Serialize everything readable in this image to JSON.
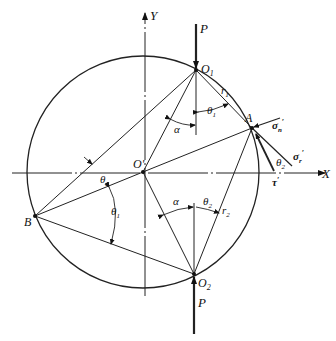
{
  "diagram": {
    "type": "geometric-stress-diagram",
    "axes": {
      "x_label": "X",
      "y_label": "Y"
    },
    "points": {
      "center": "O'",
      "top": "O",
      "top_sub": "1",
      "bottom": "O",
      "bottom_sub": "2",
      "right": "A",
      "left": "B"
    },
    "loads": {
      "top": "P",
      "bottom": "P"
    },
    "radii": {
      "r1": "r",
      "r1_sub": "1",
      "r2": "r",
      "r2_sub": "2"
    },
    "angles": {
      "alpha_top": "α",
      "alpha_bottom": "α",
      "theta1_top": "θ",
      "theta1_top_sub": "1",
      "theta2_bottom": "θ",
      "theta2_bottom_sub": "2",
      "theta2_left": "θ",
      "theta2_left_sub": "2",
      "theta1_left": "θ",
      "theta1_left_sub": "1",
      "theta2_right": "θ",
      "theta2_right_sub": "2"
    },
    "stresses": {
      "sigma_n": "σ",
      "sigma_n_sub": "n",
      "sigma_r": "σ",
      "sigma_r_sub": "r",
      "tau": "τ",
      "prime": "′"
    }
  }
}
